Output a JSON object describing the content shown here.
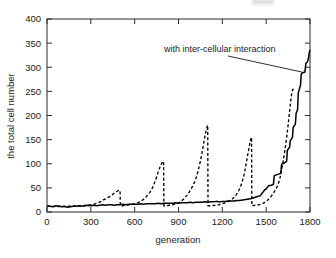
{
  "chart_data": {
    "type": "line",
    "title": "",
    "xlabel": "generation",
    "ylabel": "the total  cell number",
    "xlim": [
      0,
      1800
    ],
    "ylim": [
      0,
      400
    ],
    "xticks": [
      0,
      300,
      600,
      900,
      1200,
      1500,
      1800
    ],
    "yticks": [
      0,
      50,
      100,
      150,
      200,
      250,
      300,
      350,
      400
    ],
    "grid": false,
    "legend_position": "none",
    "annotations": [
      {
        "text": "with inter-cellular interaction",
        "points_to_series": "with inter-cellular interaction",
        "x": 1745,
        "y": 290
      }
    ],
    "series": [
      {
        "name": "with inter-cellular interaction",
        "style": "solid",
        "color": "#000000",
        "points": [
          [
            0,
            12
          ],
          [
            20,
            12
          ],
          [
            40,
            11
          ],
          [
            60,
            13
          ],
          [
            80,
            12
          ],
          [
            100,
            11
          ],
          [
            120,
            12
          ],
          [
            140,
            10
          ],
          [
            160,
            11
          ],
          [
            180,
            12
          ],
          [
            200,
            12
          ],
          [
            220,
            13
          ],
          [
            240,
            12
          ],
          [
            260,
            13
          ],
          [
            280,
            14
          ],
          [
            300,
            13
          ],
          [
            320,
            14
          ],
          [
            340,
            13
          ],
          [
            360,
            14
          ],
          [
            380,
            15
          ],
          [
            400,
            14
          ],
          [
            420,
            15
          ],
          [
            440,
            15
          ],
          [
            460,
            14
          ],
          [
            480,
            15
          ],
          [
            500,
            15
          ],
          [
            520,
            16
          ],
          [
            540,
            15
          ],
          [
            560,
            16
          ],
          [
            580,
            16
          ],
          [
            600,
            16
          ],
          [
            620,
            16
          ],
          [
            640,
            17
          ],
          [
            660,
            16
          ],
          [
            680,
            17
          ],
          [
            700,
            17
          ],
          [
            720,
            17
          ],
          [
            740,
            17
          ],
          [
            760,
            18
          ],
          [
            780,
            17
          ],
          [
            800,
            18
          ],
          [
            820,
            18
          ],
          [
            840,
            18
          ],
          [
            860,
            18
          ],
          [
            880,
            19
          ],
          [
            900,
            18
          ],
          [
            920,
            19
          ],
          [
            940,
            19
          ],
          [
            960,
            19
          ],
          [
            980,
            20
          ],
          [
            1000,
            19
          ],
          [
            1020,
            20
          ],
          [
            1040,
            20
          ],
          [
            1060,
            20
          ],
          [
            1080,
            21
          ],
          [
            1100,
            20
          ],
          [
            1120,
            21
          ],
          [
            1140,
            21
          ],
          [
            1160,
            22
          ],
          [
            1180,
            21
          ],
          [
            1200,
            22
          ],
          [
            1220,
            22
          ],
          [
            1240,
            23
          ],
          [
            1260,
            23
          ],
          [
            1280,
            23
          ],
          [
            1300,
            24
          ],
          [
            1320,
            24
          ],
          [
            1340,
            25
          ],
          [
            1360,
            26
          ],
          [
            1380,
            27
          ],
          [
            1400,
            28
          ],
          [
            1420,
            30
          ],
          [
            1440,
            32
          ],
          [
            1460,
            34
          ],
          [
            1470,
            38
          ],
          [
            1480,
            42
          ],
          [
            1490,
            46
          ],
          [
            1500,
            48
          ],
          [
            1510,
            52
          ],
          [
            1520,
            55
          ],
          [
            1530,
            55
          ],
          [
            1540,
            56
          ],
          [
            1550,
            58
          ],
          [
            1555,
            75
          ],
          [
            1560,
            76
          ],
          [
            1570,
            77
          ],
          [
            1580,
            78
          ],
          [
            1590,
            79
          ],
          [
            1600,
            80
          ],
          [
            1605,
            98
          ],
          [
            1610,
            100
          ],
          [
            1620,
            101
          ],
          [
            1630,
            103
          ],
          [
            1640,
            105
          ],
          [
            1645,
            128
          ],
          [
            1650,
            130
          ],
          [
            1655,
            132
          ],
          [
            1660,
            134
          ],
          [
            1665,
            148
          ],
          [
            1670,
            150
          ],
          [
            1675,
            152
          ],
          [
            1680,
            155
          ],
          [
            1685,
            175
          ],
          [
            1690,
            178
          ],
          [
            1695,
            180
          ],
          [
            1700,
            183
          ],
          [
            1705,
            205
          ],
          [
            1710,
            208
          ],
          [
            1715,
            212
          ],
          [
            1720,
            248
          ],
          [
            1725,
            252
          ],
          [
            1730,
            258
          ],
          [
            1735,
            262
          ],
          [
            1740,
            285
          ],
          [
            1745,
            288
          ],
          [
            1755,
            289
          ],
          [
            1765,
            290
          ],
          [
            1772,
            308
          ],
          [
            1778,
            310
          ],
          [
            1784,
            312
          ],
          [
            1790,
            320
          ],
          [
            1795,
            330
          ],
          [
            1800,
            336
          ]
        ]
      },
      {
        "name": "without inter-cellular interaction",
        "style": "dashed",
        "color": "#000000",
        "points": [
          [
            0,
            12
          ],
          [
            30,
            12
          ],
          [
            60,
            11
          ],
          [
            90,
            12
          ],
          [
            120,
            11
          ],
          [
            150,
            12
          ],
          [
            180,
            12
          ],
          [
            210,
            13
          ],
          [
            240,
            13
          ],
          [
            270,
            14
          ],
          [
            300,
            15
          ],
          [
            320,
            16
          ],
          [
            340,
            18
          ],
          [
            355,
            20
          ],
          [
            370,
            22
          ],
          [
            385,
            25
          ],
          [
            400,
            27
          ],
          [
            415,
            30
          ],
          [
            430,
            32
          ],
          [
            445,
            35
          ],
          [
            455,
            38
          ],
          [
            465,
            40
          ],
          [
            475,
            42
          ],
          [
            485,
            44
          ],
          [
            495,
            45
          ],
          [
            500,
            44
          ],
          [
            502,
            13
          ],
          [
            520,
            13
          ],
          [
            540,
            14
          ],
          [
            560,
            15
          ],
          [
            580,
            16
          ],
          [
            600,
            17
          ],
          [
            620,
            19
          ],
          [
            640,
            22
          ],
          [
            655,
            25
          ],
          [
            668,
            28
          ],
          [
            680,
            32
          ],
          [
            692,
            36
          ],
          [
            703,
            40
          ],
          [
            713,
            45
          ],
          [
            722,
            50
          ],
          [
            730,
            56
          ],
          [
            738,
            62
          ],
          [
            745,
            68
          ],
          [
            752,
            74
          ],
          [
            758,
            80
          ],
          [
            765,
            86
          ],
          [
            772,
            92
          ],
          [
            778,
            97
          ],
          [
            785,
            101
          ],
          [
            792,
            104
          ],
          [
            798,
            105
          ],
          [
            800,
            13
          ],
          [
            820,
            13
          ],
          [
            840,
            14
          ],
          [
            860,
            15
          ],
          [
            880,
            17
          ],
          [
            900,
            19
          ],
          [
            918,
            22
          ],
          [
            932,
            26
          ],
          [
            945,
            30
          ],
          [
            956,
            34
          ],
          [
            966,
            38
          ],
          [
            975,
            42
          ],
          [
            983,
            46
          ],
          [
            990,
            50
          ],
          [
            997,
            54
          ],
          [
            1003,
            58
          ],
          [
            1010,
            62
          ],
          [
            1018,
            68
          ],
          [
            1026,
            76
          ],
          [
            1034,
            85
          ],
          [
            1042,
            95
          ],
          [
            1050,
            106
          ],
          [
            1058,
            118
          ],
          [
            1065,
            130
          ],
          [
            1072,
            142
          ],
          [
            1078,
            152
          ],
          [
            1084,
            162
          ],
          [
            1090,
            170
          ],
          [
            1095,
            176
          ],
          [
            1100,
            180
          ],
          [
            1102,
            13
          ],
          [
            1125,
            13
          ],
          [
            1150,
            14
          ],
          [
            1175,
            15
          ],
          [
            1200,
            17
          ],
          [
            1222,
            19
          ],
          [
            1242,
            22
          ],
          [
            1258,
            25
          ],
          [
            1272,
            28
          ],
          [
            1285,
            32
          ],
          [
            1296,
            36
          ],
          [
            1306,
            41
          ],
          [
            1315,
            46
          ],
          [
            1323,
            52
          ],
          [
            1331,
            58
          ],
          [
            1338,
            65
          ],
          [
            1345,
            73
          ],
          [
            1352,
            82
          ],
          [
            1358,
            92
          ],
          [
            1364,
            102
          ],
          [
            1370,
            112
          ],
          [
            1376,
            122
          ],
          [
            1382,
            132
          ],
          [
            1388,
            142
          ],
          [
            1394,
            150
          ],
          [
            1400,
            155
          ],
          [
            1402,
            13
          ],
          [
            1425,
            14
          ],
          [
            1450,
            15
          ],
          [
            1472,
            17
          ],
          [
            1490,
            20
          ],
          [
            1505,
            23
          ],
          [
            1518,
            27
          ],
          [
            1530,
            31
          ],
          [
            1540,
            35
          ],
          [
            1550,
            39
          ],
          [
            1558,
            43
          ],
          [
            1566,
            47
          ],
          [
            1574,
            52
          ],
          [
            1581,
            57
          ],
          [
            1588,
            63
          ],
          [
            1594,
            70
          ],
          [
            1600,
            78
          ],
          [
            1606,
            88
          ],
          [
            1612,
            98
          ],
          [
            1618,
            108
          ],
          [
            1623,
            118
          ],
          [
            1628,
            128
          ],
          [
            1633,
            138
          ],
          [
            1638,
            150
          ],
          [
            1643,
            162
          ],
          [
            1648,
            174
          ],
          [
            1653,
            188
          ],
          [
            1658,
            202
          ],
          [
            1663,
            216
          ],
          [
            1668,
            230
          ],
          [
            1673,
            242
          ],
          [
            1678,
            250
          ],
          [
            1683,
            254
          ],
          [
            1688,
            255
          ]
        ]
      }
    ]
  }
}
